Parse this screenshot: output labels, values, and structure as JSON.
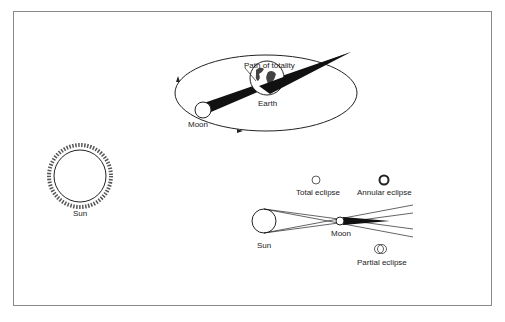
{
  "diagram": {
    "orbit": {
      "labels": {
        "path_of_totality": "Path of totality",
        "earth": "Earth",
        "moon": "Moon"
      }
    },
    "sun_large": {
      "label": "Sun"
    },
    "geometry": {
      "labels": {
        "sun": "Sun",
        "moon": "Moon",
        "total_eclipse": "Total eclipse",
        "annular_eclipse": "Annular eclipse",
        "partial_eclipse": "Partial eclipse"
      }
    },
    "colors": {
      "stroke": "#222222",
      "frame": "#8a8a8a",
      "background": "#ffffff"
    }
  }
}
